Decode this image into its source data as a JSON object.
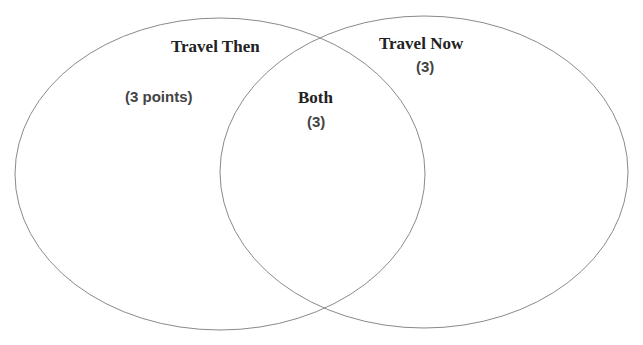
{
  "diagram": {
    "type": "venn",
    "sets": [
      {
        "name": "Travel Then",
        "count_label": "(3 points)"
      },
      {
        "name": "Travel Now",
        "count_label": "(3)"
      }
    ],
    "intersection": {
      "name": "Both",
      "count_label": "(3)"
    },
    "stroke_color": "#8a8a8a"
  }
}
